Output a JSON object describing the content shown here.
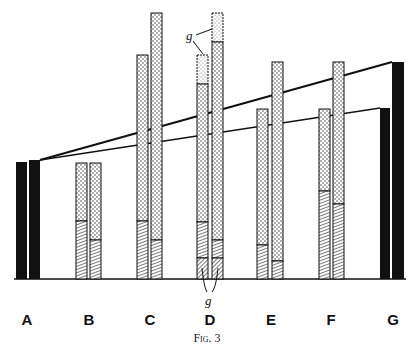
{
  "figure": {
    "caption": "Fig. 3",
    "annotation_top": "g",
    "annotation_bottom": "g",
    "labels": [
      {
        "id": "A",
        "text": "A",
        "x": 27
      },
      {
        "id": "B",
        "text": "B",
        "x": 89
      },
      {
        "id": "C",
        "text": "C",
        "x": 150
      },
      {
        "id": "D",
        "text": "D",
        "x": 210
      },
      {
        "id": "E",
        "text": "E",
        "x": 271
      },
      {
        "id": "F",
        "text": "F",
        "x": 331
      },
      {
        "id": "G",
        "text": "G",
        "x": 393
      }
    ],
    "colors": {
      "ink": "#111111",
      "paper": "#ffffff"
    }
  }
}
